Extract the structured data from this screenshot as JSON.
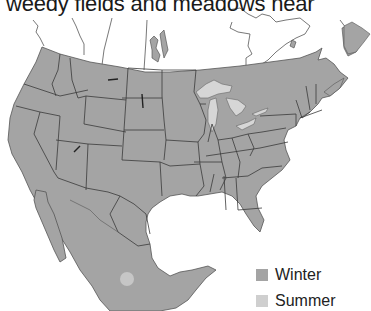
{
  "caption": "weedy fields and meadows near",
  "map": {
    "region": "North America (USA, southern Canada, Mexico)",
    "range_color": "#a4a4a4",
    "summer_spot_color": "#c6c6c6",
    "lake_color": "#d6d6d6",
    "border_color": "#3a3a3a"
  },
  "legend": {
    "items": [
      {
        "label": "Winter",
        "color": "#a4a4a4"
      },
      {
        "label": "Summer",
        "color": "#cfcfcf"
      }
    ]
  }
}
